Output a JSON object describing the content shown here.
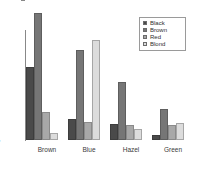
{
  "chart_data": {
    "type": "bar",
    "title": "",
    "subtitle": "",
    "xlabel": "",
    "ylabel": "",
    "categories": [
      "Brown",
      "Blue",
      "Hazel",
      "Green"
    ],
    "series": [
      {
        "name": "Black",
        "color": "#4a4a4a",
        "values": [
          68,
          20,
          15,
          5
        ]
      },
      {
        "name": "Brown",
        "color": "#767676",
        "values": [
          119,
          84,
          54,
          29
        ]
      },
      {
        "name": "Red",
        "color": "#a8a8a8",
        "values": [
          26,
          17,
          14,
          14
        ]
      },
      {
        "name": "Blond",
        "color": "#dcdcdc",
        "values": [
          7,
          94,
          10,
          16
        ]
      }
    ],
    "ylim": [
      0,
      120
    ],
    "yticks": [
      0,
      20,
      40,
      60,
      80,
      100
    ],
    "ytick_labels": [
      "0",
      "20",
      "40",
      "60",
      "80",
      "100"
    ],
    "grid": false,
    "legend": {
      "position": "top-right",
      "entries": [
        "Black",
        "Brown",
        "Red",
        "Blond"
      ]
    },
    "axis_color": "#888888",
    "background": "#ffffff"
  }
}
